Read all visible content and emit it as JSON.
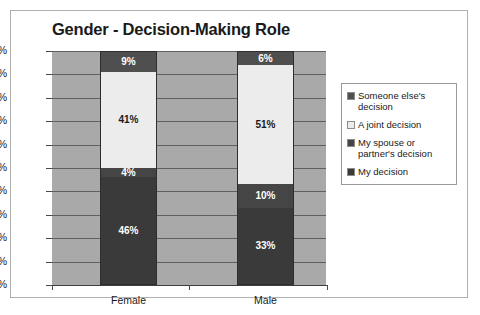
{
  "chart_data": {
    "type": "bar",
    "subtype": "stacked-bar-100",
    "title": "Gender - Decision-Making Role",
    "xlabel": "",
    "ylabel": "",
    "categories": [
      "Female",
      "Male"
    ],
    "ylim": [
      0,
      100
    ],
    "ytick_labels": [
      "0%",
      "10%",
      "20%",
      "30%",
      "40%",
      "50%",
      "60%",
      "70%",
      "80%",
      "90%",
      "100%"
    ],
    "ytick_values": [
      0,
      10,
      20,
      30,
      40,
      50,
      60,
      70,
      80,
      90,
      100
    ],
    "grid": true,
    "legend_position": "right",
    "series": [
      {
        "name": "My decision",
        "color": "#3a3a3a",
        "values": [
          46,
          33
        ],
        "labels": [
          "46%",
          "33%"
        ]
      },
      {
        "name": "My spouse or partner's decision",
        "color": "#454545",
        "values": [
          4,
          10
        ],
        "labels": [
          "4%",
          "10%"
        ]
      },
      {
        "name": "A joint decision",
        "color": "#ececec",
        "values": [
          41,
          51
        ],
        "labels": [
          "41%",
          "51%"
        ]
      },
      {
        "name": "Someone else's decision",
        "color": "#4f4f4f",
        "values": [
          9,
          6
        ],
        "labels": [
          "9%",
          "6%"
        ]
      }
    ],
    "plot_background": "#a9a9a9",
    "gridline_color": "#606060"
  },
  "legend": {
    "items": [
      {
        "label": "Someone else's decision",
        "color": "#4f4f4f"
      },
      {
        "label": "A joint decision",
        "color": "#ececec"
      },
      {
        "label": "My spouse or partner's decision",
        "color": "#454545"
      },
      {
        "label": "My decision",
        "color": "#3a3a3a"
      }
    ]
  }
}
